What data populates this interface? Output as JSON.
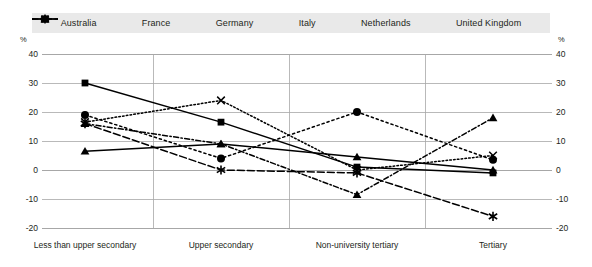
{
  "chart_data": {
    "type": "line",
    "title": "",
    "xlabel": "",
    "ylabel": "%",
    "ylim": [
      -20,
      40
    ],
    "yticks": [
      40,
      30,
      20,
      10,
      0,
      -10,
      -20
    ],
    "unit": "%",
    "grid": true,
    "legend_position": "top",
    "dual_axis": true,
    "categories": [
      "Less than upper secondary",
      "Upper secondary",
      "Non-university tertiary",
      "Tertiary"
    ],
    "series": [
      {
        "name": "Australia",
        "values": [
          6.5,
          9.0,
          4.5,
          0.0
        ],
        "marker": "triangle-up",
        "line": "solid",
        "color": "#000000"
      },
      {
        "name": "France",
        "values": [
          30.0,
          16.5,
          1.0,
          -1.0
        ],
        "marker": "square",
        "line": "solid",
        "color": "#000000"
      },
      {
        "name": "Germany",
        "values": [
          16.0,
          9.0,
          -8.5,
          18.0
        ],
        "marker": "triangle-up",
        "line": "dash-dot",
        "color": "#000000"
      },
      {
        "name": "Italy",
        "values": [
          16.5,
          24.0,
          0.0,
          5.0
        ],
        "marker": "x",
        "line": "dotted",
        "color": "#000000"
      },
      {
        "name": "Netherlands",
        "values": [
          16.0,
          0.0,
          -1.0,
          -16.0
        ],
        "marker": "star",
        "line": "dashed",
        "color": "#000000"
      },
      {
        "name": "United Kingdom",
        "values": [
          19.0,
          4.0,
          20.0,
          3.5
        ],
        "marker": "circle",
        "line": "dotted-wide",
        "color": "#000000"
      }
    ]
  },
  "legend": {
    "items": [
      {
        "label": "Australia"
      },
      {
        "label": "France"
      },
      {
        "label": "Germany"
      },
      {
        "label": "Italy"
      },
      {
        "label": "Netherlands"
      },
      {
        "label": "United Kingdom"
      }
    ],
    "background": "#e9e9e9"
  },
  "axis": {
    "unit_left": "%",
    "unit_right": "%",
    "ticks": [
      "40",
      "30",
      "20",
      "10",
      "0",
      "-10",
      "-20"
    ]
  },
  "style": {
    "grid_color": "#a7a7a7",
    "text_color": "#231f20",
    "plot_background": "#ffffff"
  }
}
